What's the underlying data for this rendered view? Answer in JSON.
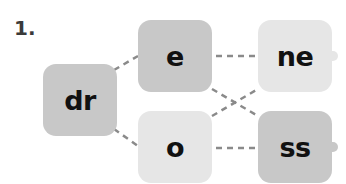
{
  "exercise": {
    "number": "1."
  },
  "nodes": {
    "root": {
      "label": "dr",
      "shade": "dark"
    },
    "middle": [
      {
        "label": "e",
        "shade": "dark"
      },
      {
        "label": "o",
        "shade": "light"
      }
    ],
    "end": [
      {
        "label": "ne",
        "shade": "light"
      },
      {
        "label": "ss",
        "shade": "dark"
      }
    ]
  },
  "connections": [
    [
      "dr",
      "e"
    ],
    [
      "dr",
      "o"
    ],
    [
      "e",
      "ne"
    ],
    [
      "e",
      "ss"
    ],
    [
      "o",
      "ne"
    ],
    [
      "o",
      "ss"
    ]
  ],
  "colors": {
    "dark_box": "#c8c8c8",
    "light_box": "#e6e6e6",
    "line": "#8a8a8a",
    "text": "#111111"
  }
}
